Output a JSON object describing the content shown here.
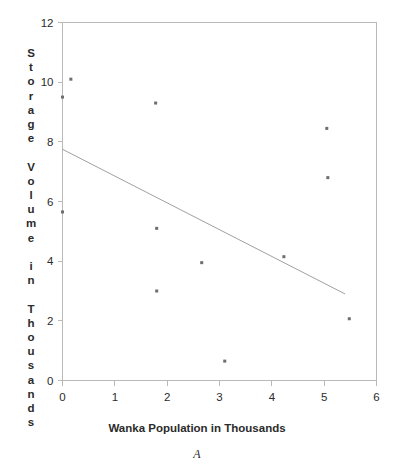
{
  "figure": {
    "caption": "A",
    "background": "#ffffff"
  },
  "chart_data": {
    "type": "scatter",
    "title": "",
    "subtitle": "",
    "xlabel": "Wanka Population in Thousands",
    "ylabel": "Storage Volume in Thousands",
    "ylabel_chars": [
      "S",
      "t",
      "o",
      "r",
      "a",
      "g",
      "e",
      "",
      "V",
      "o",
      "l",
      "u",
      "m",
      "e",
      "",
      "i",
      "n",
      "",
      "T",
      "h",
      "o",
      "u",
      "s",
      "a",
      "n",
      "d",
      "s"
    ],
    "xlim": [
      0,
      6
    ],
    "ylim": [
      0,
      12
    ],
    "xticks": [
      0,
      1,
      2,
      3,
      4,
      5,
      6
    ],
    "xtick_labels": [
      "0",
      "1",
      "2",
      "3",
      "4",
      "5",
      "6"
    ],
    "yticks": [
      0,
      2,
      4,
      6,
      8,
      10,
      12
    ],
    "ytick_labels": [
      "0",
      "2",
      "4",
      "6",
      "8",
      "10",
      "12"
    ],
    "grid": false,
    "legend": false,
    "legend_position": "none",
    "point_color": "#6e6e6e",
    "line_color": "#a0a0a0",
    "axis_color": "#b9b9b9",
    "series": [
      {
        "name": "Observations",
        "marker": "square",
        "x": [
          0.16,
          0.0,
          1.78,
          5.05,
          0.0,
          5.07,
          1.8,
          2.66,
          4.23,
          1.8,
          5.48,
          3.1
        ],
        "y": [
          10.1,
          9.5,
          9.3,
          8.45,
          5.65,
          6.8,
          5.1,
          3.95,
          4.15,
          3.0,
          2.07,
          0.65
        ],
        "points": [
          {
            "x": 0.16,
            "y": 10.1
          },
          {
            "x": 0.0,
            "y": 9.5
          },
          {
            "x": 1.78,
            "y": 9.3
          },
          {
            "x": 5.05,
            "y": 8.45
          },
          {
            "x": 5.07,
            "y": 6.8
          },
          {
            "x": 0.0,
            "y": 5.65
          },
          {
            "x": 1.8,
            "y": 5.1
          },
          {
            "x": 4.23,
            "y": 4.15
          },
          {
            "x": 2.66,
            "y": 3.95
          },
          {
            "x": 1.8,
            "y": 3.0
          },
          {
            "x": 5.48,
            "y": 2.07
          },
          {
            "x": 3.1,
            "y": 0.65
          }
        ]
      }
    ],
    "trendline": {
      "name": "Least squares fit",
      "x_start": 0.0,
      "y_start": 7.75,
      "x_end": 5.4,
      "y_end": 2.9,
      "slope": -0.898,
      "intercept": 7.75
    },
    "annotations": []
  }
}
